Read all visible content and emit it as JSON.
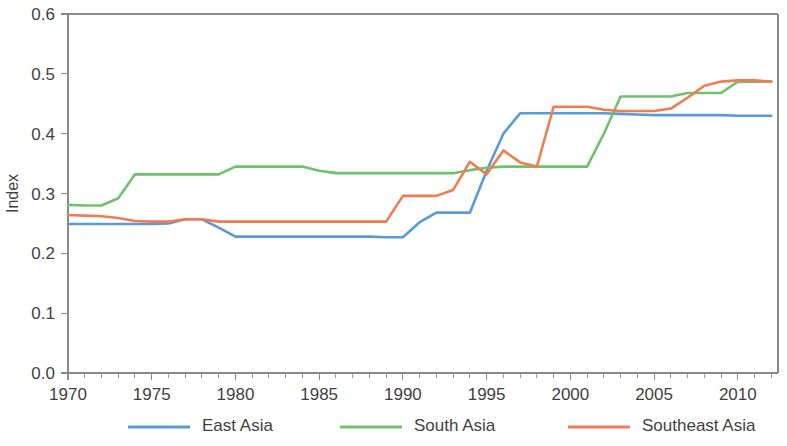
{
  "chart_data": {
    "type": "line",
    "title": "",
    "subtitle": "",
    "xlabel": "",
    "ylabel": "Index",
    "xlim": [
      1970,
      2012.4
    ],
    "ylim": [
      0.0,
      0.6
    ],
    "grid": false,
    "legend_position": "bottom",
    "x_ticks": [
      1970,
      1975,
      1980,
      1985,
      1990,
      1995,
      2000,
      2005,
      2010
    ],
    "x_tick_labels": [
      "1970",
      "1975",
      "1980",
      "1985",
      "1990",
      "1995",
      "2000",
      "2005",
      "2010"
    ],
    "x_minor_tick_step": 1,
    "y_ticks": [
      0.0,
      0.1,
      0.2,
      0.3,
      0.4,
      0.5,
      0.6
    ],
    "y_tick_labels": [
      "0.0",
      "0.1",
      "0.2",
      "0.3",
      "0.4",
      "0.5",
      "0.6"
    ],
    "x": [
      1970,
      1971,
      1972,
      1973,
      1974,
      1975,
      1976,
      1977,
      1978,
      1979,
      1980,
      1981,
      1982,
      1983,
      1984,
      1985,
      1986,
      1987,
      1988,
      1989,
      1990,
      1991,
      1992,
      1993,
      1994,
      1995,
      1996,
      1997,
      1998,
      1999,
      2000,
      2001,
      2002,
      2003,
      2004,
      2005,
      2006,
      2007,
      2008,
      2009,
      2010,
      2011,
      2012
    ],
    "series": [
      {
        "name": "East Asia",
        "color": "#5b9bd5",
        "values": [
          0.249,
          0.249,
          0.249,
          0.249,
          0.249,
          0.249,
          0.25,
          0.257,
          0.257,
          0.243,
          0.228,
          0.228,
          0.228,
          0.228,
          0.228,
          0.228,
          0.228,
          0.228,
          0.228,
          0.227,
          0.227,
          0.252,
          0.268,
          0.268,
          0.268,
          0.338,
          0.4,
          0.434,
          0.434,
          0.434,
          0.434,
          0.434,
          0.434,
          0.433,
          0.432,
          0.431,
          0.431,
          0.431,
          0.431,
          0.431,
          0.43,
          0.43,
          0.43
        ]
      },
      {
        "name": "South Asia",
        "color": "#70c16e",
        "values": [
          0.281,
          0.28,
          0.28,
          0.292,
          0.332,
          0.332,
          0.332,
          0.332,
          0.332,
          0.332,
          0.345,
          0.345,
          0.345,
          0.345,
          0.345,
          0.338,
          0.334,
          0.334,
          0.334,
          0.334,
          0.334,
          0.334,
          0.334,
          0.334,
          0.339,
          0.343,
          0.345,
          0.345,
          0.345,
          0.345,
          0.345,
          0.345,
          0.4,
          0.462,
          0.462,
          0.462,
          0.462,
          0.468,
          0.468,
          0.468,
          0.487,
          0.487,
          0.487
        ]
      },
      {
        "name": "Southeast Asia",
        "color": "#ee7d52",
        "values": [
          0.264,
          0.263,
          0.262,
          0.259,
          0.254,
          0.253,
          0.253,
          0.257,
          0.257,
          0.253,
          0.253,
          0.253,
          0.253,
          0.253,
          0.253,
          0.253,
          0.253,
          0.253,
          0.253,
          0.253,
          0.296,
          0.296,
          0.296,
          0.306,
          0.353,
          0.332,
          0.372,
          0.352,
          0.345,
          0.445,
          0.445,
          0.445,
          0.44,
          0.438,
          0.438,
          0.438,
          0.442,
          0.46,
          0.48,
          0.487,
          0.489,
          0.489,
          0.487
        ]
      }
    ],
    "legend": [
      {
        "label": "East Asia",
        "color": "#5b9bd5"
      },
      {
        "label": "South Asia",
        "color": "#70c16e"
      },
      {
        "label": "Southeast Asia",
        "color": "#ee7d52"
      }
    ]
  }
}
